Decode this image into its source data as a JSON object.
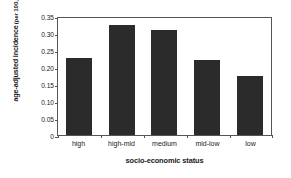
{
  "chart_data": {
    "type": "bar",
    "title": "",
    "xlabel": "socio-economic status",
    "ylabel_line1": "age-adjusted incidence",
    "ylabel_line2": "(per 100,000)",
    "categories": [
      "high",
      "high-mid",
      "medium",
      "mid-low",
      "low"
    ],
    "values": [
      0.227,
      0.323,
      0.31,
      0.222,
      0.175
    ],
    "ylim": [
      0,
      0.35
    ],
    "ytick_labels": [
      "0.35",
      "0.30",
      "0.25",
      "0.20",
      "0.15",
      "0.10",
      "0.05",
      "0"
    ],
    "ytick_values": [
      0.35,
      0.3,
      0.25,
      0.2,
      0.15,
      0.1,
      0.05,
      0
    ],
    "grid": false,
    "legend": null,
    "bar_color": "#2b2b2b",
    "axis_color": "#555555",
    "background": "#ffffff"
  }
}
